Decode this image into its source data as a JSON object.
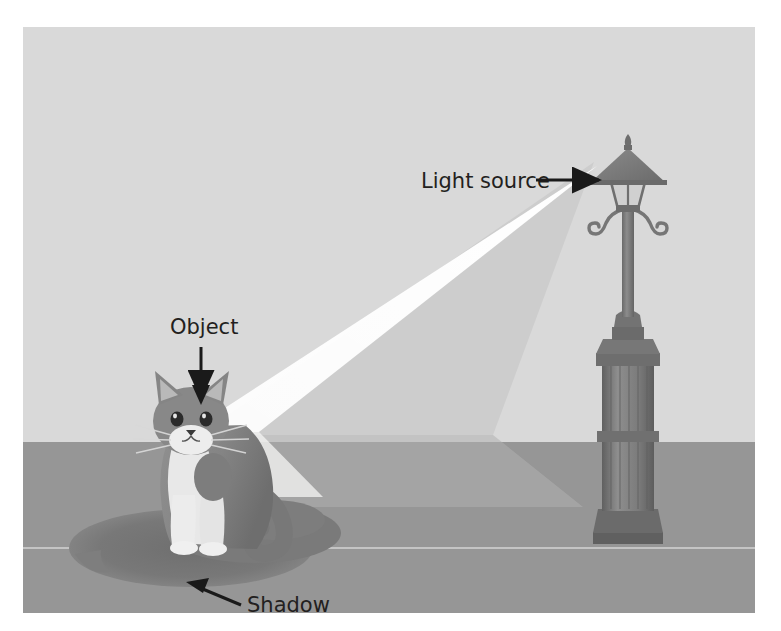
{
  "figure": {
    "scene_description": "A cat sits on the ground to the left of a tall street lamp; a cone of light from the lamp head falls on the cat and casts a long shadow to the left.",
    "annotations": [
      {
        "id": "light-source",
        "label": "Light source",
        "target": "street-lamp-head",
        "arrow_direction": "right",
        "label_x": 398,
        "label_y": 161,
        "arrow_from": [
          513,
          153
        ],
        "arrow_to": [
          578,
          153
        ]
      },
      {
        "id": "object",
        "label": "Object",
        "target": "cat",
        "arrow_direction": "down",
        "label_x": 147,
        "label_y": 307,
        "arrow_from": [
          178,
          320
        ],
        "arrow_to": [
          178,
          372
        ]
      },
      {
        "id": "shadow",
        "label": "Shadow",
        "target": "cat-shadow",
        "arrow_direction": "up-left",
        "label_x": 224,
        "label_y": 585,
        "arrow_from": [
          217,
          577
        ],
        "arrow_to": [
          167,
          556
        ]
      }
    ],
    "scene_elements": [
      {
        "name": "sky-wall",
        "description": "light grey background / wall"
      },
      {
        "name": "ground",
        "description": "mid grey ground plane"
      },
      {
        "name": "kerb-line",
        "description": "faint light horizontal line across the ground"
      },
      {
        "name": "light-beam",
        "description": "bright wedge of light from lamp head to cat"
      },
      {
        "name": "street-lamp",
        "description": "victorian street lamp with finial, conical cap, glass lantern, scroll brackets, fluted column base"
      },
      {
        "name": "cat",
        "description": "grey and white cat sitting, facing forward"
      },
      {
        "name": "cat-shadow",
        "description": "long dark elliptical shadow cast to the left of the cat"
      }
    ],
    "colors": {
      "background_page": "#ffffff",
      "sky": "#d9d9d9",
      "ground": "#969696",
      "beam_core": "#fdfdfb",
      "beam_glow": "#cfcfcf",
      "beam_glow_ground": "#b4b4b4",
      "shadow": "#7e7e7e",
      "lamp_metal": "#7f7f7f",
      "lamp_metal_dark": "#6d6d6d",
      "cat_fur": "#8a8a8a",
      "cat_fur_dark": "#6f6f6f",
      "cat_white": "#ececec",
      "label_text": "#231f20",
      "kerb_line": "#d3d3d3"
    },
    "geometry": {
      "horizon_y": 415,
      "kerb_y": 521,
      "figure_width": 732,
      "figure_height": 586
    }
  }
}
